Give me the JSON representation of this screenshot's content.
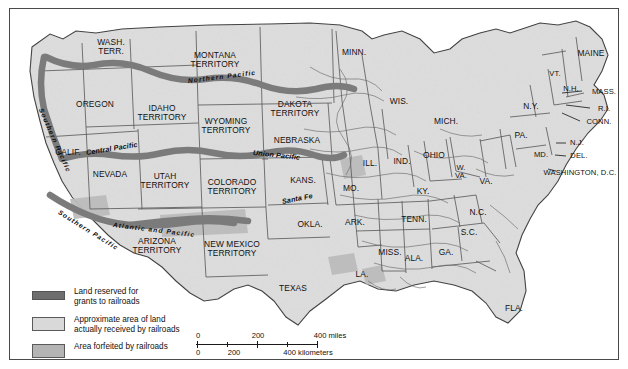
{
  "figure": {
    "frame_color": "#4a4a4a"
  },
  "legend": {
    "items": [
      {
        "swatch": "dark-bar",
        "label": "Land reserved for\ngrants to railroads",
        "color": "#6e6e6e"
      },
      {
        "swatch": "light-box",
        "label": "Approximate area of land\nactually received by railroads",
        "color": "#d9d9d9"
      },
      {
        "swatch": "mid-box",
        "label": "Area forfeited by railroads",
        "color": "#b4b4b4"
      }
    ]
  },
  "scale_bar": {
    "miles": {
      "ticks": [
        "0",
        "200",
        "400"
      ],
      "unit": "400 miles"
    },
    "kilometers": {
      "ticks": [
        "0",
        "200",
        "400"
      ],
      "unit": "400 kilometers"
    },
    "miles_labels": [
      "0",
      "200",
      "400 miles"
    ],
    "km_labels": [
      "0",
      "200",
      "400 kilometers"
    ]
  },
  "railroads": [
    {
      "name": "Northern Pacific",
      "x": 178,
      "y": 68,
      "rot": -7
    },
    {
      "name": "Southern Pacific",
      "x": 31,
      "y": 96,
      "rot": 66
    },
    {
      "name": "Central Pacific",
      "x": 76,
      "y": 139,
      "rot": -9
    },
    {
      "name": "Union Pacific",
      "x": 243,
      "y": 139,
      "rot": 6
    },
    {
      "name": "Southern Pacific",
      "x": 49,
      "y": 199,
      "rot": 32
    },
    {
      "name": "Atlantic and Pacific",
      "x": 103,
      "y": 212,
      "rot": 7
    },
    {
      "name": "Santa Fe",
      "x": 272,
      "y": 188,
      "rot": -11
    }
  ],
  "places": [
    {
      "name": "WASH.\nTERR.",
      "x": 101,
      "y": 38,
      "size": "sz9"
    },
    {
      "name": "OREGON",
      "x": 85,
      "y": 95,
      "size": "sz9"
    },
    {
      "name": "CALIF.",
      "x": 58,
      "y": 143,
      "size": "sz9"
    },
    {
      "name": "NEVADA",
      "x": 100,
      "y": 165,
      "size": "sz9"
    },
    {
      "name": "IDAHO\nTERRITORY",
      "x": 152,
      "y": 104,
      "size": "sz9"
    },
    {
      "name": "MONTANA\nTERRITORY",
      "x": 205,
      "y": 51,
      "size": "sz9"
    },
    {
      "name": "WYOMING\nTERRITORY",
      "x": 216,
      "y": 117,
      "size": "sz9"
    },
    {
      "name": "UTAH\nTERRITORY",
      "x": 155,
      "y": 172,
      "size": "sz9"
    },
    {
      "name": "COLORADO\nTERRITORY",
      "x": 222,
      "y": 178,
      "size": "sz9"
    },
    {
      "name": "DAKOTA\nTERRITORY",
      "x": 285,
      "y": 100,
      "size": "sz9"
    },
    {
      "name": "NEBRASKA",
      "x": 287,
      "y": 131,
      "size": "sz9"
    },
    {
      "name": "ARIZONA\nTERRITORY",
      "x": 147,
      "y": 237,
      "size": "sz9"
    },
    {
      "name": "NEW MEXICO\nTERRITORY",
      "x": 222,
      "y": 240,
      "size": "sz9"
    },
    {
      "name": "TEXAS",
      "x": 283,
      "y": 279,
      "size": "sz9"
    },
    {
      "name": "KANS.",
      "x": 293,
      "y": 171,
      "size": "sz9"
    },
    {
      "name": "OKLA.",
      "x": 300,
      "y": 215,
      "size": "sz9"
    },
    {
      "name": "MINN.",
      "x": 344,
      "y": 43,
      "size": "sz9"
    },
    {
      "name": "WIS.",
      "x": 389,
      "y": 92,
      "size": "sz9"
    },
    {
      "name": "MICH.",
      "x": 436,
      "y": 112,
      "size": "sz9"
    },
    {
      "name": "ILL.",
      "x": 360,
      "y": 154,
      "size": "sz9"
    },
    {
      "name": "IND.",
      "x": 392,
      "y": 152,
      "size": "sz9"
    },
    {
      "name": "OHIO",
      "x": 424,
      "y": 146,
      "size": "sz9"
    },
    {
      "name": "MO.",
      "x": 341,
      "y": 179,
      "size": "sz9"
    },
    {
      "name": "ARK.",
      "x": 345,
      "y": 213,
      "size": "sz9"
    },
    {
      "name": "LA.",
      "x": 352,
      "y": 265,
      "size": "sz9"
    },
    {
      "name": "MISS.",
      "x": 380,
      "y": 243,
      "size": "sz9"
    },
    {
      "name": "ALA.",
      "x": 404,
      "y": 249,
      "size": "sz9"
    },
    {
      "name": "TENN.",
      "x": 404,
      "y": 210,
      "size": "sz9"
    },
    {
      "name": "KY.",
      "x": 413,
      "y": 182,
      "size": "sz9"
    },
    {
      "name": "GA.",
      "x": 436,
      "y": 243,
      "size": "sz9"
    },
    {
      "name": "FLA.",
      "x": 504,
      "y": 299,
      "size": "sz9"
    },
    {
      "name": "S.C.",
      "x": 459,
      "y": 223,
      "size": "sz9"
    },
    {
      "name": "N.C.",
      "x": 468,
      "y": 203,
      "size": "sz9"
    },
    {
      "name": "W.\nVA.",
      "x": 451,
      "y": 163,
      "size": "sz8"
    },
    {
      "name": "VA.",
      "x": 476,
      "y": 172,
      "size": "sz9"
    },
    {
      "name": "PA.",
      "x": 511,
      "y": 126,
      "size": "sz9"
    },
    {
      "name": "N.Y.",
      "x": 521,
      "y": 97,
      "size": "sz9"
    },
    {
      "name": "MAINE",
      "x": 581,
      "y": 44,
      "size": "sz9"
    },
    {
      "name": "VT.",
      "x": 545,
      "y": 65,
      "size": "sz8"
    },
    {
      "name": "N.H.",
      "x": 561,
      "y": 80,
      "size": "sz8"
    },
    {
      "name": "MASS.",
      "x": 594,
      "y": 83,
      "size": "sz8"
    },
    {
      "name": "R.I.",
      "x": 594,
      "y": 100,
      "size": "sz8"
    },
    {
      "name": "CONN.",
      "x": 589,
      "y": 113,
      "size": "sz8"
    },
    {
      "name": "N.J.",
      "x": 567,
      "y": 134,
      "size": "sz8"
    },
    {
      "name": "DEL.",
      "x": 569,
      "y": 147,
      "size": "sz8"
    },
    {
      "name": "MD.",
      "x": 531,
      "y": 146,
      "size": "sz8"
    },
    {
      "name": "WASHINGTON, D.C.",
      "x": 570,
      "y": 164,
      "size": "sz8"
    }
  ]
}
